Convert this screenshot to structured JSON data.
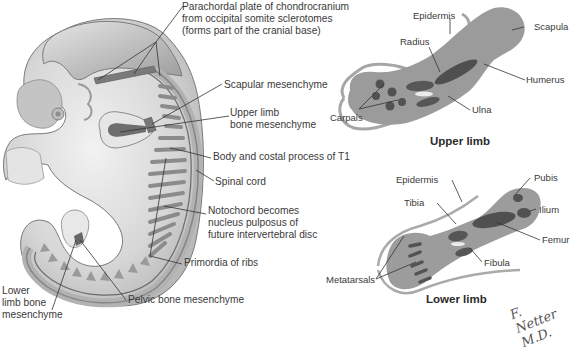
{
  "figure": {
    "embryo_labels": {
      "parachordal": [
        "Parachordal plate of chondrocranium",
        "from occipital somite sclerotomes",
        "(forms part of the cranial base)"
      ],
      "scapular": "Scapular mesenchyme",
      "upper_limb_bone": [
        "Upper limb",
        "bone mesenchyme"
      ],
      "body_costal": "Body and costal process of T1",
      "spinal_cord": "Spinal cord",
      "notochord": [
        "Notochord becomes",
        "nucleus pulposus of",
        "future intervertebral disc"
      ],
      "primordia_ribs": "Primordia of ribs",
      "pelvic": "Pelvic bone mesenchyme",
      "lower_limb_bone": [
        "Lower",
        "limb bone",
        "mesenchyme"
      ]
    },
    "upper_limb": {
      "caption": "Upper limb",
      "labels": {
        "epidermis": "Epidermis",
        "scapula": "Scapula",
        "radius": "Radius",
        "humerus": "Humerus",
        "carpals": "Carpals",
        "ulna": "Ulna"
      }
    },
    "lower_limb": {
      "caption": "Lower limb",
      "labels": {
        "epidermis": "Epidermis",
        "pubis": "Pubis",
        "tibia": "Tibia",
        "ilium": "Ilium",
        "femur": "Femur",
        "fibula": "Fibula",
        "metatarsals": "Metatarsals"
      }
    },
    "signature": "F. Netter M.D.",
    "colors": {
      "background": "#ffffff",
      "embryo_body": "#d9d9d9",
      "embryo_shadow": "#9e9e9e",
      "mesenchyme": "#6e6e6e",
      "limb_bud": "#a8a8a8",
      "bone": "#555555",
      "leader_line": "#333333",
      "text": "#3a3a3a"
    }
  }
}
